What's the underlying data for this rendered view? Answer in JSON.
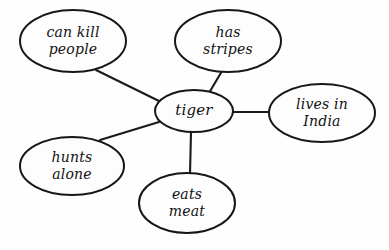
{
  "diagram": {
    "type": "concept-map",
    "background_color": "#ffffff",
    "stroke_color": "#171717",
    "text_color": "#121212",
    "handwriting_style": "cursive",
    "center_node": {
      "id": "tiger",
      "label": "tiger",
      "lines": [
        "tiger"
      ],
      "cx": 194,
      "cy": 111,
      "rx": 39,
      "ry": 21,
      "font_size": 15
    },
    "nodes": [
      {
        "id": "can-kill-people",
        "label": "can kill people",
        "lines": [
          "can kill",
          "people"
        ],
        "cx": 73,
        "cy": 41,
        "rx": 53,
        "ry": 31,
        "font_size": 14
      },
      {
        "id": "has-stripes",
        "label": "has stripes",
        "lines": [
          "has",
          "stripes"
        ],
        "cx": 228,
        "cy": 41,
        "rx": 53,
        "ry": 31,
        "font_size": 14
      },
      {
        "id": "lives-in-india",
        "label": "lives in India",
        "lines": [
          "lives in",
          "India"
        ],
        "cx": 322,
        "cy": 113,
        "rx": 53,
        "ry": 29,
        "font_size": 14
      },
      {
        "id": "hunts-alone",
        "label": "hunts alone",
        "lines": [
          "hunts",
          "alone"
        ],
        "cx": 72,
        "cy": 166,
        "rx": 52,
        "ry": 29,
        "font_size": 14
      },
      {
        "id": "eats-meat",
        "label": "eats meat",
        "lines": [
          "eats",
          "meat"
        ],
        "cx": 187,
        "cy": 203,
        "rx": 48,
        "ry": 30,
        "font_size": 14
      }
    ],
    "edges": [
      {
        "id": "edge-tiger-can-kill-people",
        "from": "tiger",
        "to": "can-kill-people",
        "x1": 161,
        "y1": 102,
        "x2": 96,
        "y2": 70
      },
      {
        "id": "edge-tiger-has-stripes",
        "from": "tiger",
        "to": "has-stripes",
        "x1": 209,
        "y1": 93,
        "x2": 222,
        "y2": 71
      },
      {
        "id": "edge-tiger-lives-in-india",
        "from": "tiger",
        "to": "lives-in-india",
        "x1": 233,
        "y1": 112,
        "x2": 270,
        "y2": 112
      },
      {
        "id": "edge-tiger-hunts-alone",
        "from": "tiger",
        "to": "hunts-alone",
        "x1": 159,
        "y1": 122,
        "x2": 100,
        "y2": 140
      },
      {
        "id": "edge-tiger-eats-meat",
        "from": "tiger",
        "to": "eats-meat",
        "x1": 191,
        "y1": 132,
        "x2": 190,
        "y2": 174
      }
    ]
  }
}
